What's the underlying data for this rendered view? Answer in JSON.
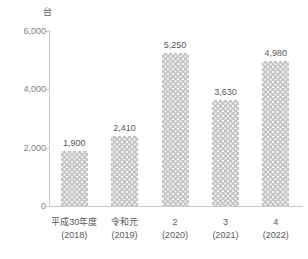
{
  "chart_data": {
    "type": "bar",
    "title": "",
    "subtitle": "",
    "unit_label": "台",
    "xlabel": "",
    "ylabel": "",
    "ylim": [
      0,
      6000
    ],
    "yticks": [
      "0",
      "2,000",
      "4,000",
      "6,000"
    ],
    "ytick_values": [
      0,
      2000,
      4000,
      6000
    ],
    "grid": false,
    "legend": false,
    "categories": [
      "平成30年度",
      "令和元",
      "2",
      "3",
      "4"
    ],
    "category_sublabels": [
      "(2018)",
      "(2019)",
      "(2020)",
      "(2021)",
      "(2022)"
    ],
    "values": [
      1900,
      2410,
      5250,
      3630,
      4980
    ],
    "value_labels": [
      "1,900",
      "2,410",
      "5,250",
      "3,630",
      "4,980"
    ],
    "bar_color": "#c4c4c4",
    "axis_color": "#c9c9c9",
    "text_color": "#595959",
    "tick_text_color": "#7f7f7f"
  }
}
